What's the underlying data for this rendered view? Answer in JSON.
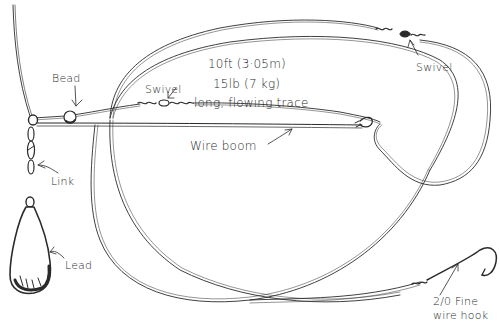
{
  "diagram": {
    "colors": {
      "ink": "#2a2a2a",
      "background": "#ffffff"
    },
    "labels": {
      "bead": "Bead",
      "swivel_left": "Swivel",
      "swivel_right": "Swivel",
      "trace_length": "10ft (3·05m)",
      "trace_strength": "15lb (7 kg)",
      "trace_desc": "long, flowing trace",
      "wire_boom": "Wire boom",
      "link": "Link",
      "lead": "Lead",
      "hook_line1": "2/0 Fine",
      "hook_line2": "wire hook"
    },
    "components": [
      {
        "name": "main-line",
        "description": "Vertical main line from top-left"
      },
      {
        "name": "bead",
        "description": "Bead on main line"
      },
      {
        "name": "swivel-left",
        "description": "Swivel joining trace near boom"
      },
      {
        "name": "wire-boom",
        "description": "Horizontal wire boom"
      },
      {
        "name": "link",
        "description": "Chain link connecting lead"
      },
      {
        "name": "lead",
        "description": "Pear-shaped lead weight"
      },
      {
        "name": "trace",
        "description": "Long flowing looping trace"
      },
      {
        "name": "swivel-right",
        "description": "Swivel at top right of trace"
      },
      {
        "name": "hook",
        "description": "2/0 fine wire hook"
      }
    ]
  }
}
